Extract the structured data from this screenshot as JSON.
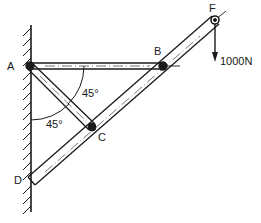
{
  "diagram": {
    "type": "truss_frame",
    "points": {
      "A": {
        "label": "A",
        "x": 30,
        "y": 66
      },
      "B": {
        "label": "B",
        "x": 163,
        "y": 66
      },
      "C": {
        "label": "C",
        "x": 92,
        "y": 127
      },
      "D": {
        "label": "D",
        "x": 31,
        "y": 181
      },
      "F": {
        "label": "F",
        "x": 215,
        "y": 20
      }
    },
    "members": [
      {
        "from": "A",
        "to": "B"
      },
      {
        "from": "A",
        "to": "C"
      },
      {
        "from": "D",
        "to": "F"
      }
    ],
    "angles": [
      {
        "label": "45°",
        "between": "AB-AC"
      },
      {
        "label": "45°",
        "between": "wall-AC"
      }
    ],
    "load": {
      "point": "F",
      "label": "1000N",
      "direction": "down"
    },
    "support": {
      "type": "wall",
      "side": "left"
    },
    "colors": {
      "ink": "#1a1a1a",
      "background": "#ffffff"
    }
  }
}
